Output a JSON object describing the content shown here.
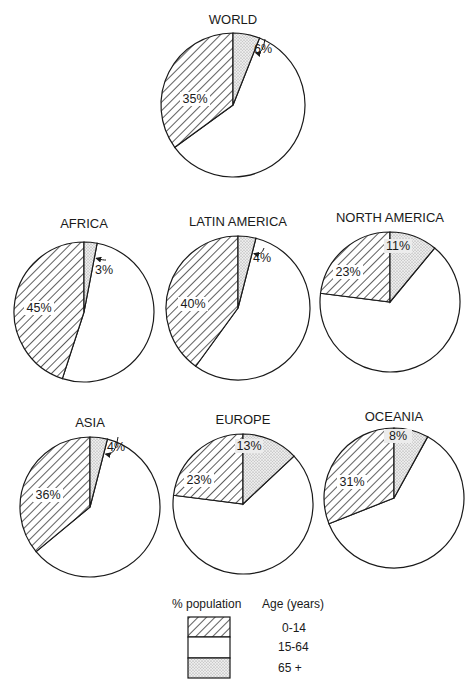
{
  "chart_data": {
    "type": "pie",
    "legend": {
      "header_left": "% population",
      "header_right": "Age (years)",
      "entries": [
        {
          "label": "0-14",
          "pattern": "hatched"
        },
        {
          "label": "15-64",
          "pattern": "white"
        },
        {
          "label": "65 +",
          "pattern": "dotted"
        }
      ]
    },
    "categories": [
      "0-14",
      "15-64",
      "65+"
    ],
    "charts": [
      {
        "name": "WORLD",
        "values": [
          35,
          59,
          6
        ],
        "labels": [
          "35%",
          "",
          "6%"
        ]
      },
      {
        "name": "AFRICA",
        "values": [
          45,
          52,
          3
        ],
        "labels": [
          "45%",
          "",
          "3%"
        ]
      },
      {
        "name": "LATIN AMERICA",
        "values": [
          40,
          56,
          4
        ],
        "labels": [
          "40%",
          "",
          "4%"
        ]
      },
      {
        "name": "NORTH AMERICA",
        "values": [
          23,
          66,
          11
        ],
        "labels": [
          "23%",
          "",
          "11%"
        ]
      },
      {
        "name": "ASIA",
        "values": [
          36,
          60,
          4
        ],
        "labels": [
          "36%",
          "",
          "4%"
        ]
      },
      {
        "name": "EUROPE",
        "values": [
          23,
          64,
          13
        ],
        "labels": [
          "23%",
          "",
          "13%"
        ]
      },
      {
        "name": "OCEANIA",
        "values": [
          31,
          61,
          8
        ],
        "labels": [
          "31%",
          "",
          "8%"
        ]
      }
    ]
  },
  "pies": [
    {
      "title": "WORLD",
      "young_label": "35%",
      "old_label": "6%"
    },
    {
      "title": "AFRICA",
      "young_label": "45%",
      "old_label": "3%"
    },
    {
      "title": "LATIN AMERICA",
      "young_label": "40%",
      "old_label": "4%"
    },
    {
      "title": "NORTH AMERICA",
      "young_label": "23%",
      "old_label": "11%"
    },
    {
      "title": "ASIA",
      "young_label": "36%",
      "old_label": "4%"
    },
    {
      "title": "EUROPE",
      "young_label": "23%",
      "old_label": "13%"
    },
    {
      "title": "OCEANIA",
      "young_label": "31%",
      "old_label": "8%"
    }
  ],
  "legend": {
    "header_left": "% population",
    "header_right": "Age (years)",
    "items": [
      "0-14",
      "15-64",
      "65 +"
    ]
  }
}
